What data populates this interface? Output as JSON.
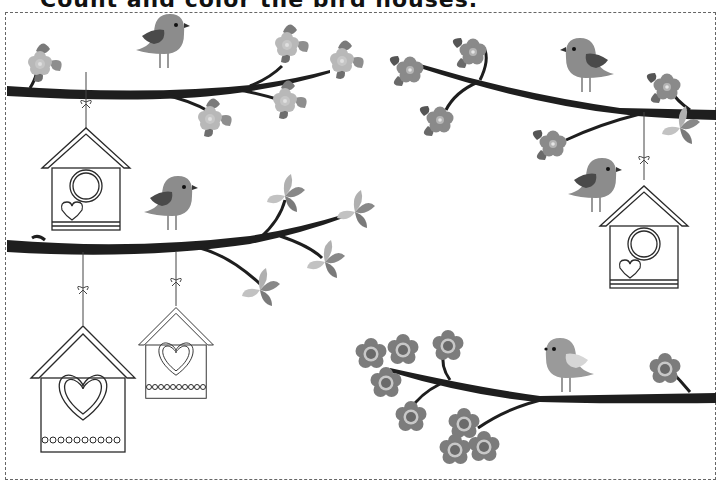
{
  "worksheet": {
    "title": "Count and color the bird houses.",
    "colors": {
      "branch": "#1e1e1e",
      "bird_body": "#8c8c8c",
      "bird_body_light": "#a3a3a3",
      "bird_wing": "#4a4a4a",
      "bird_wing_light": "#d6d6d6",
      "flower_petal": "#b8b8b8",
      "flower_dark": "#7a7a7a",
      "leaf_dark": "#6e6e6e",
      "leaf_light": "#b0b0b0",
      "outline": "#2a2a2a",
      "border": "#666666"
    },
    "birdhouses": [
      {
        "id": "top-left",
        "decoration": "round-hole-heart"
      },
      {
        "id": "middle-left-large",
        "decoration": "heart-dots"
      },
      {
        "id": "middle-left-small",
        "decoration": "heart-dots"
      },
      {
        "id": "right",
        "decoration": "round-hole-heart"
      }
    ],
    "birds_count": 5,
    "birdhouses_count": 4
  }
}
